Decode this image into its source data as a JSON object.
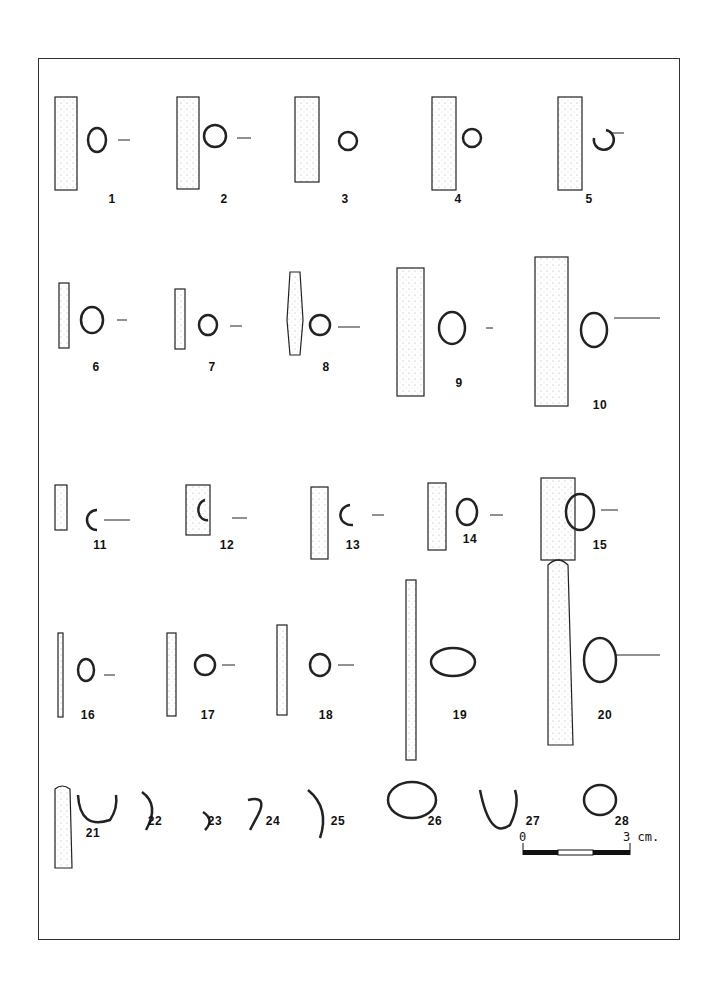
{
  "figure": {
    "items": [
      {
        "n": "1",
        "x": 112,
        "y": 200
      },
      {
        "n": "2",
        "x": 224,
        "y": 200
      },
      {
        "n": "3",
        "x": 345,
        "y": 200
      },
      {
        "n": "4",
        "x": 458,
        "y": 200
      },
      {
        "n": "5",
        "x": 589,
        "y": 200
      },
      {
        "n": "6",
        "x": 96,
        "y": 368
      },
      {
        "n": "7",
        "x": 212,
        "y": 368
      },
      {
        "n": "8",
        "x": 326,
        "y": 368
      },
      {
        "n": "9",
        "x": 459,
        "y": 384
      },
      {
        "n": "10",
        "x": 600,
        "y": 406
      },
      {
        "n": "11",
        "x": 100,
        "y": 546
      },
      {
        "n": "12",
        "x": 227,
        "y": 546
      },
      {
        "n": "13",
        "x": 353,
        "y": 546
      },
      {
        "n": "14",
        "x": 470,
        "y": 540
      },
      {
        "n": "15",
        "x": 600,
        "y": 546
      },
      {
        "n": "16",
        "x": 88,
        "y": 716
      },
      {
        "n": "17",
        "x": 208,
        "y": 716
      },
      {
        "n": "18",
        "x": 326,
        "y": 716
      },
      {
        "n": "19",
        "x": 460,
        "y": 716
      },
      {
        "n": "20",
        "x": 605,
        "y": 716
      },
      {
        "n": "21",
        "x": 93,
        "y": 834
      },
      {
        "n": "22",
        "x": 155,
        "y": 822
      },
      {
        "n": "23",
        "x": 215,
        "y": 822
      },
      {
        "n": "24",
        "x": 273,
        "y": 822
      },
      {
        "n": "25",
        "x": 338,
        "y": 822
      },
      {
        "n": "26",
        "x": 435,
        "y": 822
      },
      {
        "n": "27",
        "x": 533,
        "y": 822
      },
      {
        "n": "28",
        "x": 622,
        "y": 822
      }
    ],
    "scale_bar": {
      "start_label": "0",
      "end_label": "3 cm."
    }
  }
}
